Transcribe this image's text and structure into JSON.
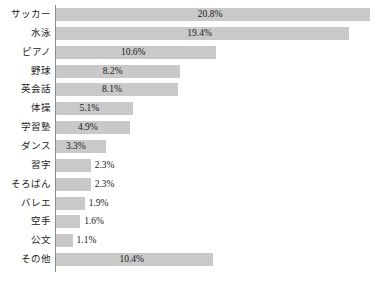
{
  "chart_data": {
    "type": "bar",
    "orientation": "horizontal",
    "title": "",
    "subtitle": "",
    "xlabel": "",
    "ylabel": "",
    "grid": false,
    "legend": false,
    "legend_position": "none",
    "xlim": [
      0,
      21.5
    ],
    "axis_visible": {
      "category_axis": true,
      "value_axis": false
    },
    "value_suffix": "%",
    "bar_color": "#c9c9c9",
    "axis_color": "#8c8c8c",
    "text_color": "#1a1a1a",
    "categories": [
      "サッカー",
      "水泳",
      "ピアノ",
      "野球",
      "英会話",
      "体操",
      "学習塾",
      "ダンス",
      "習字",
      "そろばん",
      "バレエ",
      "空手",
      "公文",
      "その他"
    ],
    "values": [
      20.8,
      19.4,
      10.6,
      8.2,
      8.1,
      5.1,
      4.9,
      3.3,
      2.3,
      2.3,
      1.9,
      1.6,
      1.1,
      10.4
    ],
    "value_labels": [
      "20.8%",
      "19.4%",
      "10.6%",
      "8.2%",
      "8.1%",
      "5.1%",
      "4.9%",
      "3.3%",
      "2.3%",
      "2.3%",
      "1.9%",
      "1.6%",
      "1.1%",
      "10.4%"
    ],
    "label_placement": [
      "inside",
      "inside",
      "inside",
      "inside",
      "inside",
      "inside",
      "inside",
      "inside",
      "outside",
      "outside",
      "outside",
      "outside",
      "outside",
      "inside"
    ]
  }
}
